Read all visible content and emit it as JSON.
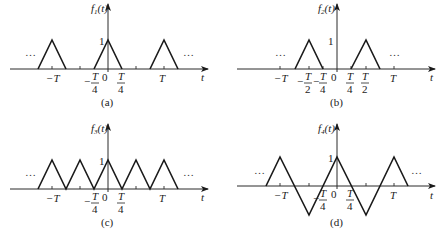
{
  "figure": {
    "panels": [
      {
        "id": "a",
        "caption": "(a)",
        "ylabel": "f",
        "ylabel_sub": "1",
        "ylabel_arg": "(t)",
        "xlabel": "t",
        "peak_label": "1",
        "ellipsis": "…",
        "ticks": {
          "neg_T": "−T",
          "T": "T",
          "zero": "0",
          "T_num": "T",
          "four": "4",
          "minus": "−"
        },
        "description": "Periodic train of triangular pulses of height 1, width T/2 (from -T/4 to T/4), period T"
      },
      {
        "id": "b",
        "caption": "(b)",
        "ylabel": "f",
        "ylabel_sub": "2",
        "ylabel_arg": "(t)",
        "xlabel": "t",
        "peak_label": "1",
        "ellipsis": "…",
        "ticks": {
          "neg_T": "−T",
          "T": "T",
          "zero": "0",
          "T_num": "T",
          "two": "2",
          "four": "4",
          "minus": "−"
        },
        "description": "Triangular pulses of height 1 centered at ±T/2, each spanning T/4 to 3T/4, period T"
      },
      {
        "id": "c",
        "caption": "(c)",
        "ylabel": "f",
        "ylabel_sub": "3",
        "ylabel_arg": "(t)",
        "xlabel": "t",
        "peak_label": "1",
        "ellipsis": "…",
        "ticks": {
          "neg_T": "−T",
          "T": "T",
          "zero": "0",
          "T_num": "T",
          "four": "4",
          "minus": "−"
        },
        "description": "Continuous triangular wave between 0 and 1, period T/2"
      },
      {
        "id": "d",
        "caption": "(d)",
        "ylabel": "f",
        "ylabel_sub": "4",
        "ylabel_arg": "(t)",
        "xlabel": "t",
        "peak_label": "1",
        "ellipsis": "…",
        "ticks": {
          "neg_T": "−T",
          "T": "T",
          "zero": "0",
          "T_num": "T",
          "four": "4",
          "minus": "−"
        },
        "description": "Continuous triangular wave between -1 and 1, period T"
      }
    ]
  },
  "colors": {
    "line": "#1a1a1a",
    "axis": "#2a2a2a",
    "text": "#222222",
    "background": "#ffffff"
  }
}
